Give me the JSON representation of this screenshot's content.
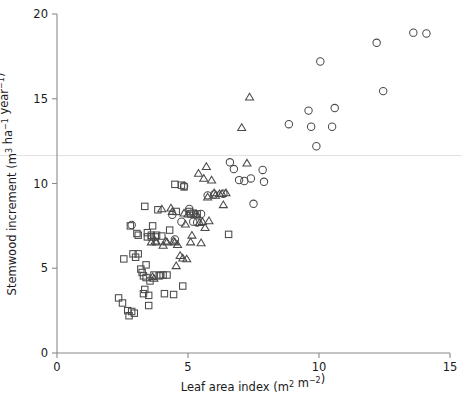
{
  "chart_data": {
    "type": "scatter",
    "title": "",
    "xlabel": "Leaf area index (m2 m-2)",
    "ylabel": "Stemwood increment (m3 ha-1 year-1)",
    "xlabel_parts": {
      "text": "Leaf area index (m",
      "sup1": "2",
      "mid": " m",
      "sup2": "−2",
      "close": ")"
    },
    "ylabel_parts": {
      "text": "Stemwood increment (m",
      "sup1": "3",
      "mid": " ha",
      "sup2": "−1",
      "mid2": " year",
      "sup3": "−1",
      "close": ")"
    },
    "xlim": [
      0,
      15
    ],
    "ylim": [
      0,
      20
    ],
    "xticks": [
      0,
      5,
      10,
      15
    ],
    "yticks": [
      0,
      5,
      10,
      15,
      20
    ],
    "xtick_labels": [
      "0",
      "5",
      "10",
      "15"
    ],
    "ytick_labels": [
      "0",
      "5",
      "10",
      "15",
      "20"
    ],
    "grid": false,
    "legend": "none",
    "reference_lines": [
      {
        "axis": "y",
        "value": 11.65,
        "color": "#e2e2e2"
      }
    ],
    "marker_colors": {
      "stroke": "#4a4a4a",
      "fill": "none"
    },
    "series": [
      {
        "name": "squares",
        "marker": "square",
        "points": [
          [
            2.35,
            3.25
          ],
          [
            2.5,
            2.95
          ],
          [
            2.55,
            5.55
          ],
          [
            2.7,
            2.5
          ],
          [
            2.75,
            2.2
          ],
          [
            2.8,
            7.5
          ],
          [
            2.85,
            2.45
          ],
          [
            2.9,
            5.85
          ],
          [
            2.95,
            2.35
          ],
          [
            3.0,
            5.65
          ],
          [
            3.05,
            7.05
          ],
          [
            3.1,
            6.95
          ],
          [
            3.1,
            5.85
          ],
          [
            3.2,
            4.95
          ],
          [
            3.25,
            4.75
          ],
          [
            3.3,
            3.5
          ],
          [
            3.3,
            4.55
          ],
          [
            3.35,
            8.65
          ],
          [
            3.35,
            3.75
          ],
          [
            3.4,
            5.2
          ],
          [
            3.4,
            4.45
          ],
          [
            3.45,
            7.1
          ],
          [
            3.45,
            6.85
          ],
          [
            3.5,
            3.4
          ],
          [
            3.5,
            2.8
          ],
          [
            3.55,
            4.25
          ],
          [
            3.6,
            6.95
          ],
          [
            3.6,
            6.85
          ],
          [
            3.65,
            7.5
          ],
          [
            3.7,
            4.6
          ],
          [
            3.75,
            6.85
          ],
          [
            3.8,
            6.95
          ],
          [
            3.85,
            8.45
          ],
          [
            3.9,
            4.55
          ],
          [
            3.95,
            4.6
          ],
          [
            4.0,
            6.9
          ],
          [
            4.05,
            4.6
          ],
          [
            4.1,
            3.5
          ],
          [
            4.2,
            4.6
          ],
          [
            4.3,
            7.25
          ],
          [
            4.45,
            3.45
          ],
          [
            4.5,
            9.95
          ],
          [
            4.55,
            8.35
          ],
          [
            4.75,
            9.9
          ],
          [
            4.8,
            3.95
          ],
          [
            4.85,
            9.8
          ],
          [
            5.05,
            8.35
          ],
          [
            5.1,
            8.2
          ],
          [
            5.2,
            8.25
          ],
          [
            5.35,
            8.2
          ],
          [
            6.55,
            7.0
          ]
        ]
      },
      {
        "name": "triangles",
        "marker": "triangle",
        "points": [
          [
            3.6,
            6.55
          ],
          [
            3.65,
            4.5
          ],
          [
            3.7,
            4.4
          ],
          [
            3.75,
            6.6
          ],
          [
            3.8,
            6.55
          ],
          [
            4.0,
            8.5
          ],
          [
            4.05,
            6.35
          ],
          [
            4.15,
            6.6
          ],
          [
            4.2,
            6.55
          ],
          [
            4.35,
            8.55
          ],
          [
            4.4,
            8.35
          ],
          [
            4.45,
            6.6
          ],
          [
            4.5,
            6.55
          ],
          [
            4.55,
            5.15
          ],
          [
            4.6,
            6.4
          ],
          [
            4.7,
            5.75
          ],
          [
            4.8,
            5.6
          ],
          [
            4.85,
            8.25
          ],
          [
            4.9,
            7.6
          ],
          [
            4.95,
            5.55
          ],
          [
            5.0,
            8.2
          ],
          [
            5.1,
            6.55
          ],
          [
            5.15,
            6.95
          ],
          [
            5.3,
            8.2
          ],
          [
            5.35,
            8.15
          ],
          [
            5.4,
            10.6
          ],
          [
            5.45,
            7.7
          ],
          [
            5.5,
            6.5
          ],
          [
            5.55,
            7.75
          ],
          [
            5.6,
            10.3
          ],
          [
            5.65,
            7.4
          ],
          [
            5.7,
            11.0
          ],
          [
            5.75,
            9.2
          ],
          [
            5.8,
            7.8
          ],
          [
            5.9,
            10.2
          ],
          [
            6.0,
            9.45
          ],
          [
            6.05,
            9.3
          ],
          [
            6.2,
            9.4
          ],
          [
            6.3,
            9.4
          ],
          [
            6.35,
            8.75
          ],
          [
            6.45,
            9.45
          ],
          [
            7.05,
            13.3
          ],
          [
            7.25,
            11.2
          ],
          [
            7.35,
            15.1
          ]
        ]
      },
      {
        "name": "circles",
        "marker": "circle",
        "points": [
          [
            2.85,
            7.55
          ],
          [
            4.4,
            8.15
          ],
          [
            4.5,
            6.7
          ],
          [
            4.75,
            7.75
          ],
          [
            4.85,
            9.85
          ],
          [
            5.05,
            8.5
          ],
          [
            5.2,
            7.75
          ],
          [
            5.35,
            7.7
          ],
          [
            5.5,
            8.2
          ],
          [
            5.75,
            9.3
          ],
          [
            6.0,
            9.35
          ],
          [
            6.35,
            9.4
          ],
          [
            6.6,
            11.25
          ],
          [
            6.75,
            10.85
          ],
          [
            6.95,
            10.2
          ],
          [
            7.15,
            10.15
          ],
          [
            7.4,
            10.3
          ],
          [
            7.5,
            8.8
          ],
          [
            7.85,
            10.8
          ],
          [
            7.9,
            10.1
          ],
          [
            8.85,
            13.5
          ],
          [
            9.6,
            14.3
          ],
          [
            9.7,
            13.35
          ],
          [
            9.9,
            12.2
          ],
          [
            10.05,
            17.2
          ],
          [
            10.5,
            13.35
          ],
          [
            10.6,
            14.45
          ],
          [
            12.2,
            18.3
          ],
          [
            12.45,
            15.45
          ],
          [
            13.6,
            18.9
          ],
          [
            14.1,
            18.85
          ]
        ]
      }
    ]
  },
  "plot_geometry": {
    "left": 57,
    "right": 450,
    "top": 14,
    "bottom": 353,
    "marker_size": 6.4
  }
}
